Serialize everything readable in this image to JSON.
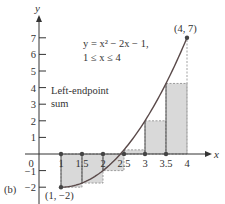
{
  "chart_data": {
    "type": "area",
    "title": "",
    "panel_label": "(b)",
    "function_label_line1": "y = x² − 2x − 1,",
    "function_label_line2": "1 ≤ x ≤ 4",
    "sum_label_line1": "Left-endpoint",
    "sum_label_line2": "sum",
    "xlabel": "x",
    "ylabel": "y",
    "xlim": [
      0,
      4
    ],
    "ylim": [
      -2,
      7
    ],
    "grid": false,
    "x_ticks": [
      "0",
      "1",
      "1.5",
      "2",
      "2.5",
      "3",
      "3.5",
      "4"
    ],
    "y_ticks": [
      "-2",
      "-1",
      "1",
      "2",
      "3",
      "4",
      "5",
      "6",
      "7"
    ],
    "curve": {
      "expression": "x^2 - 2x - 1",
      "domain": [
        1,
        4
      ],
      "x": [
        1,
        1.5,
        2,
        2.5,
        3,
        3.5,
        4
      ],
      "y": [
        -2,
        -1.75,
        -1,
        0.25,
        2,
        4.25,
        7
      ]
    },
    "rectangles": {
      "method": "left-endpoint",
      "dx": 0.5,
      "left_x": [
        1,
        1.5,
        2,
        2.5,
        3,
        3.5
      ],
      "heights": [
        -2,
        -1.75,
        -1,
        0.25,
        2,
        4.25
      ]
    },
    "annotations": [
      {
        "label": "(1, −2)",
        "x": 1,
        "y": -2
      },
      {
        "label": "(4, 7)",
        "x": 4,
        "y": 7
      }
    ],
    "colors": {
      "rect_fill": "#d9d9d9",
      "rect_edge": "#888888",
      "curve": "#5a4a4a",
      "axis": "#333333"
    }
  }
}
